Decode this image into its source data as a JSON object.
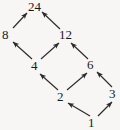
{
  "diagram": {
    "type": "hasse-diagram",
    "background_color": "#f7f6f4",
    "ink_color": "#1a1a1a",
    "nodes": [
      {
        "id": "n24",
        "label": "24",
        "x": 32,
        "y": 7
      },
      {
        "id": "n8",
        "label": "8",
        "x": 6,
        "y": 35
      },
      {
        "id": "n12",
        "label": "12",
        "x": 63,
        "y": 35
      },
      {
        "id": "n4",
        "label": "4",
        "x": 35,
        "y": 66
      },
      {
        "id": "n6",
        "label": "6",
        "x": 91,
        "y": 65
      },
      {
        "id": "n2",
        "label": "2",
        "x": 61,
        "y": 97
      },
      {
        "id": "n3",
        "label": "3",
        "x": 113,
        "y": 94
      },
      {
        "id": "n1",
        "label": "1",
        "x": 92,
        "y": 123
      }
    ],
    "edges": [
      {
        "id": "e-8-24",
        "from": "8",
        "to": "24",
        "x1": 13,
        "y1": 28,
        "x2": 27,
        "y2": 13
      },
      {
        "id": "e-12-24",
        "from": "12",
        "to": "24",
        "x1": 60,
        "y1": 29,
        "x2": 42,
        "y2": 12
      },
      {
        "id": "e-4-8",
        "from": "4",
        "to": "8",
        "x1": 32,
        "y1": 59,
        "x2": 13,
        "y2": 42
      },
      {
        "id": "e-4-12",
        "from": "4",
        "to": "12",
        "x1": 41,
        "y1": 59,
        "x2": 59,
        "y2": 43
      },
      {
        "id": "e-6-12",
        "from": "6",
        "to": "12",
        "x1": 88,
        "y1": 59,
        "x2": 71,
        "y2": 43
      },
      {
        "id": "e-2-4",
        "from": "2",
        "to": "4",
        "x1": 58,
        "y1": 90,
        "x2": 40,
        "y2": 74
      },
      {
        "id": "e-2-6",
        "from": "2",
        "to": "6",
        "x1": 67,
        "y1": 90,
        "x2": 87,
        "y2": 73
      },
      {
        "id": "e-3-6",
        "from": "3",
        "to": "6",
        "x1": 112,
        "y1": 87,
        "x2": 97,
        "y2": 72
      },
      {
        "id": "e-1-2",
        "from": "1",
        "to": "2",
        "x1": 90,
        "y1": 116,
        "x2": 68,
        "y2": 103
      },
      {
        "id": "e-1-3",
        "from": "1",
        "to": "3",
        "x1": 98,
        "y1": 116,
        "x2": 112,
        "y2": 102
      }
    ]
  }
}
